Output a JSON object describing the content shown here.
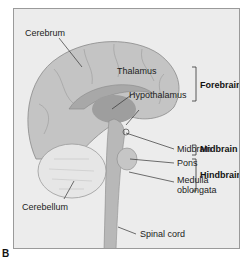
{
  "figure": {
    "panel_letter": "B",
    "labels": {
      "cerebrum": "Cerebrum",
      "thalamus": "Thalamus",
      "hypothalamus": "Hypothalamus",
      "midbrain": "Midbrain",
      "pons": "Pons",
      "medulla_line1": "Medulla",
      "medulla_line2": "oblongata",
      "cerebellum": "Cerebellum",
      "spinal_cord": "Spinal cord"
    },
    "groups": {
      "forebrain": "Forebrain",
      "midbrain": "Midbrain",
      "hindbrain": "Hindbrain"
    },
    "colors": {
      "background": "#ececec",
      "brain": "#c4c4c4",
      "brain_dark": "#9e9e9e",
      "cerebellum": "#e6e6e6",
      "leader_lines": "#333333"
    }
  }
}
